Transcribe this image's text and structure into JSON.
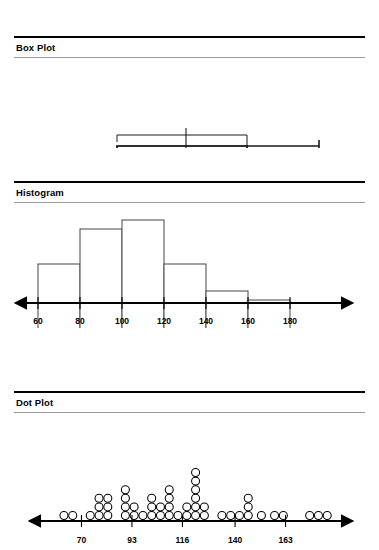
{
  "page": {
    "background": "#ffffff",
    "ink": "#000000",
    "rule_gray": "#9a9a9a",
    "hist_outline": "#555555"
  },
  "panels": [
    {
      "id": "box-plot",
      "title": "Box Plot"
    },
    {
      "id": "histogram",
      "title": "Histogram"
    },
    {
      "id": "dot-plot",
      "title": "Dot Plot"
    }
  ],
  "chart_data": [
    {
      "type": "box",
      "title": "Box Plot",
      "xlabel": "",
      "ylabel": "",
      "grid": false,
      "legend": "none",
      "orientation": "horizontal",
      "axis_shown": false,
      "xlim": [
        55,
        190
      ],
      "box": {
        "whisker_low": 62,
        "q1": 92,
        "median": 114,
        "q3": 140,
        "whisker_high": 177,
        "mean": 114,
        "mean_diamond_low": 103,
        "mean_diamond_high": 126,
        "confidence_bracket_low": 92,
        "confidence_bracket_high": 140
      }
    },
    {
      "type": "bar",
      "subtype": "histogram",
      "title": "Histogram",
      "xlabel": "",
      "ylabel": "",
      "grid": false,
      "legend": "none",
      "bin_width": 20,
      "bin_edges": [
        60,
        80,
        100,
        120,
        140,
        160,
        180
      ],
      "categories": [
        "60-80",
        "80-100",
        "100-120",
        "120-140",
        "140-160",
        "160-180"
      ],
      "values": [
        5,
        9,
        10,
        5,
        2.5,
        1.8
      ],
      "ticks": [
        60,
        80,
        100,
        120,
        140,
        160,
        180
      ],
      "tick_labels": [
        "60",
        "80",
        "100",
        "120",
        "140",
        "160",
        "180"
      ],
      "xlim": [
        50,
        190
      ],
      "ylim": [
        0,
        11
      ]
    },
    {
      "type": "dot",
      "title": "Dot Plot",
      "xlabel": "",
      "ylabel": "",
      "grid": false,
      "legend": "none",
      "ticks": [
        70,
        93,
        116,
        140,
        163
      ],
      "tick_labels": [
        "70",
        "93",
        "116",
        "140",
        "163"
      ],
      "xlim": [
        52,
        186
      ],
      "dot_diameter": 8,
      "stacks": [
        {
          "x": 62,
          "count": 1
        },
        {
          "x": 66,
          "count": 1
        },
        {
          "x": 74,
          "count": 1
        },
        {
          "x": 78,
          "count": 3
        },
        {
          "x": 82,
          "count": 3
        },
        {
          "x": 90,
          "count": 4
        },
        {
          "x": 94,
          "count": 2
        },
        {
          "x": 98,
          "count": 1
        },
        {
          "x": 102,
          "count": 3
        },
        {
          "x": 106,
          "count": 2
        },
        {
          "x": 110,
          "count": 4
        },
        {
          "x": 114,
          "count": 1
        },
        {
          "x": 118,
          "count": 2
        },
        {
          "x": 122,
          "count": 6
        },
        {
          "x": 126,
          "count": 2
        },
        {
          "x": 134,
          "count": 1
        },
        {
          "x": 138,
          "count": 1
        },
        {
          "x": 142,
          "count": 1
        },
        {
          "x": 146,
          "count": 3
        },
        {
          "x": 152,
          "count": 1
        },
        {
          "x": 158,
          "count": 1
        },
        {
          "x": 162,
          "count": 1
        },
        {
          "x": 174,
          "count": 1
        },
        {
          "x": 178,
          "count": 1
        },
        {
          "x": 182,
          "count": 1
        }
      ],
      "total_dots": 47
    }
  ]
}
